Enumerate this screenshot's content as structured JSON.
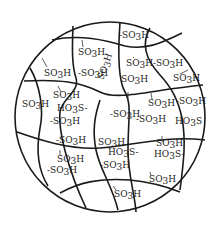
{
  "diagram": {
    "outline": {
      "cx": 110,
      "cy": 117,
      "r": 95,
      "stroke": "#1a1a1a"
    },
    "labels": [
      {
        "id": "l1",
        "text": "-SO3H",
        "x": 119,
        "y": 38
      },
      {
        "id": "l2",
        "text": "SO3H",
        "x": 78,
        "y": 55
      },
      {
        "id": "l3",
        "text": "SO3H",
        "x": 44,
        "y": 76
      },
      {
        "id": "l4",
        "text": "-SO3H",
        "x": 78,
        "y": 76
      },
      {
        "id": "l5",
        "text": "SO3H",
        "x": 126,
        "y": 66
      },
      {
        "id": "l6",
        "text": "-SO3H",
        "x": 153,
        "y": 66
      },
      {
        "id": "l7",
        "text": "SO3H",
        "x": 173,
        "y": 81
      },
      {
        "id": "l8",
        "text": "SO3H",
        "x": 121,
        "y": 82
      },
      {
        "id": "l9",
        "text": "SO3H",
        "x": 148,
        "y": 106
      },
      {
        "id": "l10",
        "text": "-SO3H",
        "x": 176,
        "y": 104
      },
      {
        "id": "l11",
        "text": "SO3H",
        "x": 22,
        "y": 107
      },
      {
        "id": "l12",
        "text": "SO3H",
        "x": 53,
        "y": 98
      },
      {
        "id": "l13",
        "text": "HO3S-",
        "x": 57,
        "y": 111
      },
      {
        "id": "l14",
        "text": "-SO3H",
        "x": 50,
        "y": 124
      },
      {
        "id": "l15",
        "text": "-SO3H",
        "x": 110,
        "y": 117
      },
      {
        "id": "l16",
        "text": "-SO3H",
        "x": 136,
        "y": 122
      },
      {
        "id": "l17",
        "text": "HO3S",
        "x": 175,
        "y": 124
      },
      {
        "id": "l18",
        "text": "SO3H",
        "x": 98,
        "y": 145
      },
      {
        "id": "l19",
        "text": "-SO3H",
        "x": 56,
        "y": 143
      },
      {
        "id": "l20",
        "text": "SO3H",
        "x": 57,
        "y": 162
      },
      {
        "id": "l21",
        "text": "-SO3H",
        "x": 47,
        "y": 173
      },
      {
        "id": "l22",
        "text": "HO3S-",
        "x": 108,
        "y": 155
      },
      {
        "id": "l23",
        "text": "-SO3H",
        "x": 100,
        "y": 168
      },
      {
        "id": "l24",
        "text": "SO3H",
        "x": 156,
        "y": 146
      },
      {
        "id": "l25",
        "text": "HO3S-",
        "x": 154,
        "y": 157
      },
      {
        "id": "l26",
        "text": "SO3H",
        "x": 149,
        "y": 182
      },
      {
        "id": "l27",
        "text": "SO3H",
        "x": 114,
        "y": 197
      }
    ],
    "vertical_label": {
      "text": "SO3H",
      "x": 103,
      "y": 80
    }
  }
}
